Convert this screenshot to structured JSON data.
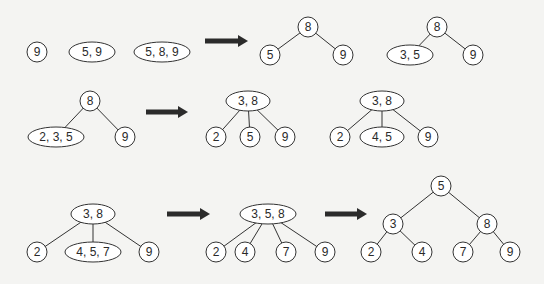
{
  "colors": {
    "background": "#f4f4f2",
    "stroke": "#333333",
    "arrow": "#2b2b2b",
    "node_fill": "#ffffff"
  },
  "steps": [
    {
      "id": "step1",
      "nodes": [
        {
          "id": "s1a",
          "label": "9",
          "x": 37,
          "y": 52,
          "shape": "circle"
        },
        {
          "id": "s1b",
          "label": "5, 9",
          "x": 92,
          "y": 52,
          "shape": "ellipse",
          "rx": 23
        },
        {
          "id": "s1c",
          "label": "5, 8, 9",
          "x": 162,
          "y": 52,
          "shape": "ellipse",
          "rx": 28
        }
      ],
      "edges": []
    },
    {
      "id": "step2",
      "nodes": [
        {
          "id": "s2r",
          "label": "8",
          "x": 308,
          "y": 27,
          "shape": "circle"
        },
        {
          "id": "s2l",
          "label": "5",
          "x": 270,
          "y": 55,
          "shape": "circle"
        },
        {
          "id": "s2g",
          "label": "9",
          "x": 343,
          "y": 55,
          "shape": "circle"
        }
      ],
      "edges": [
        [
          "s2r",
          "s2l"
        ],
        [
          "s2r",
          "s2g"
        ]
      ]
    },
    {
      "id": "step3",
      "nodes": [
        {
          "id": "s3r",
          "label": "8",
          "x": 437,
          "y": 27,
          "shape": "circle"
        },
        {
          "id": "s3l",
          "label": "3, 5",
          "x": 410,
          "y": 55,
          "shape": "ellipse",
          "rx": 23
        },
        {
          "id": "s3g",
          "label": "9",
          "x": 473,
          "y": 55,
          "shape": "circle"
        }
      ],
      "edges": [
        [
          "s3r",
          "s3l"
        ],
        [
          "s3r",
          "s3g"
        ]
      ]
    },
    {
      "id": "step4",
      "nodes": [
        {
          "id": "s4r",
          "label": "8",
          "x": 90,
          "y": 101,
          "shape": "circle"
        },
        {
          "id": "s4l",
          "label": "2, 3, 5",
          "x": 56,
          "y": 137,
          "shape": "ellipse",
          "rx": 28
        },
        {
          "id": "s4g",
          "label": "9",
          "x": 125,
          "y": 137,
          "shape": "circle"
        }
      ],
      "edges": [
        [
          "s4r",
          "s4l"
        ],
        [
          "s4r",
          "s4g"
        ]
      ]
    },
    {
      "id": "step5",
      "nodes": [
        {
          "id": "s5r",
          "label": "3, 8",
          "x": 248,
          "y": 101,
          "shape": "ellipse",
          "rx": 22
        },
        {
          "id": "s5a",
          "label": "2",
          "x": 216,
          "y": 137,
          "shape": "circle"
        },
        {
          "id": "s5b",
          "label": "5",
          "x": 250,
          "y": 137,
          "shape": "circle"
        },
        {
          "id": "s5c",
          "label": "9",
          "x": 285,
          "y": 137,
          "shape": "circle"
        }
      ],
      "edges": [
        [
          "s5r",
          "s5a"
        ],
        [
          "s5r",
          "s5b"
        ],
        [
          "s5r",
          "s5c"
        ]
      ]
    },
    {
      "id": "step6",
      "nodes": [
        {
          "id": "s6r",
          "label": "3, 8",
          "x": 382,
          "y": 101,
          "shape": "ellipse",
          "rx": 22
        },
        {
          "id": "s6a",
          "label": "2",
          "x": 340,
          "y": 137,
          "shape": "circle"
        },
        {
          "id": "s6b",
          "label": "4, 5",
          "x": 382,
          "y": 137,
          "shape": "ellipse",
          "rx": 22
        },
        {
          "id": "s6c",
          "label": "9",
          "x": 428,
          "y": 137,
          "shape": "circle"
        }
      ],
      "edges": [
        [
          "s6r",
          "s6a"
        ],
        [
          "s6r",
          "s6b"
        ],
        [
          "s6r",
          "s6c"
        ]
      ]
    },
    {
      "id": "step7",
      "nodes": [
        {
          "id": "s7r",
          "label": "3, 8",
          "x": 93,
          "y": 214,
          "shape": "ellipse",
          "rx": 22
        },
        {
          "id": "s7a",
          "label": "2",
          "x": 37,
          "y": 252,
          "shape": "circle"
        },
        {
          "id": "s7b",
          "label": "4, 5, 7",
          "x": 93,
          "y": 252,
          "shape": "ellipse",
          "rx": 28
        },
        {
          "id": "s7c",
          "label": "9",
          "x": 149,
          "y": 252,
          "shape": "circle"
        }
      ],
      "edges": [
        [
          "s7r",
          "s7a"
        ],
        [
          "s7r",
          "s7b"
        ],
        [
          "s7r",
          "s7c"
        ]
      ]
    },
    {
      "id": "step8",
      "nodes": [
        {
          "id": "s8r",
          "label": "3, 5, 8",
          "x": 268,
          "y": 214,
          "shape": "ellipse",
          "rx": 28
        },
        {
          "id": "s8a",
          "label": "2",
          "x": 216,
          "y": 252,
          "shape": "circle"
        },
        {
          "id": "s8b",
          "label": "4",
          "x": 245,
          "y": 252,
          "shape": "circle"
        },
        {
          "id": "s8c",
          "label": "7",
          "x": 286,
          "y": 252,
          "shape": "circle"
        },
        {
          "id": "s8d",
          "label": "9",
          "x": 325,
          "y": 252,
          "shape": "circle"
        }
      ],
      "edges": [
        [
          "s8r",
          "s8a"
        ],
        [
          "s8r",
          "s8b"
        ],
        [
          "s8r",
          "s8c"
        ],
        [
          "s8r",
          "s8d"
        ]
      ]
    },
    {
      "id": "step9",
      "nodes": [
        {
          "id": "s9r",
          "label": "5",
          "x": 441,
          "y": 186,
          "shape": "circle"
        },
        {
          "id": "s9l",
          "label": "3",
          "x": 393,
          "y": 224,
          "shape": "circle"
        },
        {
          "id": "s9g",
          "label": "8",
          "x": 487,
          "y": 224,
          "shape": "circle"
        },
        {
          "id": "s9a",
          "label": "2",
          "x": 371,
          "y": 252,
          "shape": "circle"
        },
        {
          "id": "s9b",
          "label": "4",
          "x": 422,
          "y": 252,
          "shape": "circle"
        },
        {
          "id": "s9c",
          "label": "7",
          "x": 463,
          "y": 252,
          "shape": "circle"
        },
        {
          "id": "s9d",
          "label": "9",
          "x": 510,
          "y": 252,
          "shape": "circle"
        }
      ],
      "edges": [
        [
          "s9r",
          "s9l"
        ],
        [
          "s9r",
          "s9g"
        ],
        [
          "s9l",
          "s9a"
        ],
        [
          "s9l",
          "s9b"
        ],
        [
          "s9g",
          "s9c"
        ],
        [
          "s9g",
          "s9d"
        ]
      ]
    }
  ],
  "arrows": [
    {
      "id": "arrow-1",
      "x1": 205,
      "x2": 248,
      "y": 41
    },
    {
      "id": "arrow-2",
      "x1": 146,
      "x2": 188,
      "y": 112
    },
    {
      "id": "arrow-3",
      "x1": 167,
      "x2": 210,
      "y": 214
    },
    {
      "id": "arrow-4",
      "x1": 325,
      "x2": 367,
      "y": 214
    }
  ]
}
